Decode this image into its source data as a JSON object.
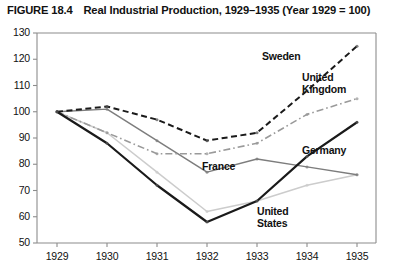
{
  "figure": {
    "number": "FIGURE 18.4",
    "title": "Real Industrial Production, 1929–1935 (Year 1929 = 100)",
    "caption_full": "FIGURE 18.4  Real Industrial Production, 1929–1935 (Year 1929 = 100)"
  },
  "chart_data": {
    "type": "line",
    "title": "Real Industrial Production, 1929–1935 (Year 1929 = 100)",
    "xlabel": "",
    "ylabel": "",
    "x": [
      1929,
      1930,
      1931,
      1932,
      1933,
      1934,
      1935
    ],
    "categories": [
      "1929",
      "1930",
      "1931",
      "1932",
      "1933",
      "1934",
      "1935"
    ],
    "xlim": [
      1929,
      1935
    ],
    "ylim": [
      50,
      130
    ],
    "yticks": [
      50,
      60,
      70,
      80,
      90,
      100,
      110,
      120,
      130
    ],
    "xticks": [
      "1929",
      "1930",
      "1931",
      "1932",
      "1933",
      "1934",
      "1935"
    ],
    "grid": false,
    "legend": "inline-labels",
    "series": [
      {
        "name": "Sweden",
        "style": "dashed",
        "color": "#1a1a1a",
        "label_x": 1933.1,
        "label_y": 121,
        "values": [
          100,
          102,
          97,
          89,
          92,
          108,
          125
        ]
      },
      {
        "name": "United Kingdom",
        "style": "dash-dot",
        "color": "#9a9a9a",
        "label_x": 1933.9,
        "label_y": 113,
        "values": [
          100,
          92,
          84,
          84,
          88,
          99,
          105
        ]
      },
      {
        "name": "Germany",
        "style": "solid-thick",
        "color": "#1a1a1a",
        "label_x": 1933.9,
        "label_y": 85,
        "values": [
          100,
          88,
          72,
          58,
          66,
          83,
          96
        ]
      },
      {
        "name": "France",
        "style": "solid",
        "color": "#7d7d7d",
        "label_x": 1931.9,
        "label_y": 79,
        "values": [
          100,
          101,
          89,
          77,
          82,
          79,
          76
        ]
      },
      {
        "name": "United States",
        "style": "solid-light",
        "color": "#cccccc",
        "label_x": 1933.0,
        "label_y": 62,
        "values": [
          100,
          92,
          77,
          62,
          66,
          72,
          76
        ]
      }
    ]
  }
}
